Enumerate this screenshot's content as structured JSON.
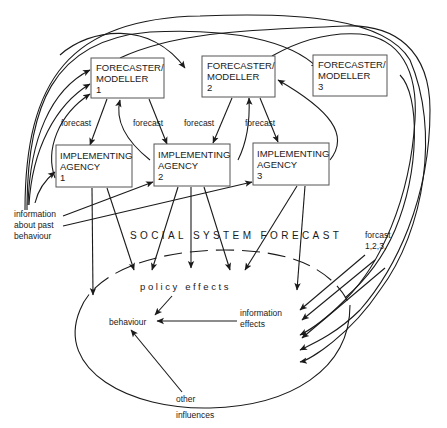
{
  "diagram": {
    "forecasters": [
      {
        "line1": "FORECASTER/",
        "line2": "MODELLER",
        "line3": "1"
      },
      {
        "line1": "FORECASTER/",
        "line2": "MODELLER",
        "line3": "2"
      },
      {
        "line1": "FORECASTER/",
        "line2": "MODELLER",
        "line3": "3"
      }
    ],
    "agencies": [
      {
        "line1": "IMPLEMENTING",
        "line2": "AGENCY",
        "line3": "1"
      },
      {
        "line1": "IMPLEMENTING",
        "line2": "AGENCY",
        "line3": "2"
      },
      {
        "line1": "IMPLEMENTING",
        "line2": "AGENCY",
        "line3": "3"
      }
    ],
    "forecast_labels": [
      "forecast",
      "forecast",
      "forecast",
      "forecast"
    ],
    "info_label": {
      "line1": "information",
      "line2": "about past",
      "line3": "behaviour"
    },
    "social_system_forecast": "SOCIAL SYSTEM FORECAST",
    "forcast_123": {
      "line1": "forcast",
      "line2": "1,2,3,"
    },
    "policy_effects": "policy effects",
    "behaviour": "behaviour",
    "information_effects": {
      "line1": "information",
      "line2": "effects"
    },
    "other_influences": {
      "line1": "other",
      "line2": "influences"
    }
  }
}
